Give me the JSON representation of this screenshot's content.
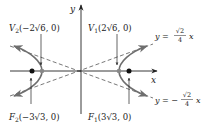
{
  "diagram": {
    "type": "hyperbola",
    "equation_hint": "x^2/24 - y^2/3 = 1",
    "axes": {
      "x_label": "x",
      "y_label": "y"
    },
    "vertices": [
      {
        "name": "V1",
        "label_main": "V",
        "label_sub": "1",
        "label_coords": "(2√6, 0)",
        "x": 4.899,
        "y": 0
      },
      {
        "name": "V2",
        "label_main": "V",
        "label_sub": "2",
        "label_coords": "(−2√6, 0)",
        "x": -4.899,
        "y": 0
      }
    ],
    "foci": [
      {
        "name": "F1",
        "label_main": "F",
        "label_sub": "1",
        "label_coords": "(3√3, 0)",
        "x": 5.196,
        "y": 0
      },
      {
        "name": "F2",
        "label_main": "F",
        "label_sub": "2",
        "label_coords": "(−3√3, 0)",
        "x": -5.196,
        "y": 0
      }
    ],
    "asymptotes": [
      {
        "label_lhs": "y = ",
        "sign": "",
        "num": "√2",
        "den": "4",
        "var": "x",
        "slope": 0.3536
      },
      {
        "label_lhs": "y = ",
        "sign": "−",
        "num": "√2",
        "den": "4",
        "var": "x",
        "slope": -0.3536
      }
    ],
    "colors": {
      "curve": "#6e6e6e",
      "axis": "#333333",
      "asymptote": "#555555",
      "point": "#111111",
      "vertex_point": "#888888"
    }
  }
}
